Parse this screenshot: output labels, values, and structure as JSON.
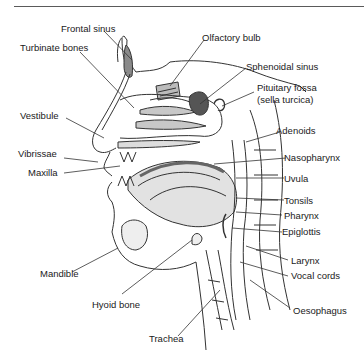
{
  "diagram": {
    "labels": {
      "frontal_sinus": "Frontal sinus",
      "turbinate_bones": "Turbinate bones",
      "olfactory_bulb": "Olfactory bulb",
      "sphenoidal_sinus": "Sphenoidal sinus",
      "pituitary_fossa": "Pituitary fossa",
      "sella_turcica": "(sella turcica)",
      "vestibule": "Vestibule",
      "adenoids": "Adenoids",
      "vibrissae": "Vibrissae",
      "nasopharynx": "Nasopharynx",
      "maxilla": "Maxilla",
      "uvula": "Uvula",
      "tonsils": "Tonsils",
      "pharynx": "Pharynx",
      "epiglottis": "Epiglottis",
      "mandible": "Mandible",
      "larynx": "Larynx",
      "vocal_cords": "Vocal cords",
      "hyoid_bone": "Hyoid bone",
      "oesophagus": "Oesophagus",
      "trachea": "Trachea"
    },
    "colors": {
      "ink": "#1a1a1a",
      "line": "#333333",
      "shade": "#9a9a9a",
      "background": "#ffffff"
    }
  }
}
